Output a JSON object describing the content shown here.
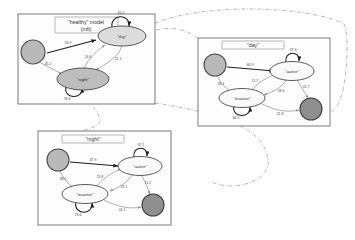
{
  "figure": {
    "background": "#ffffff",
    "accent_dark": "#1f1f1f",
    "accent_light": "#8d8d8d",
    "node_fill_day": "#dcdcdc",
    "node_fill_night": "#bdbdbd",
    "start_fill": "#b9b9b9",
    "end_fill": "#8f8f8f"
  },
  "panels": [
    {
      "id": "healthy",
      "title": "\"healthy\" model",
      "subtitle": "(mft)",
      "nodes": [
        {
          "name": "start",
          "label": "",
          "kind": "start"
        },
        {
          "name": "day",
          "label": "\"day\"",
          "kind": "state"
        },
        {
          "name": "night",
          "label": "\"night\"",
          "kind": "state"
        }
      ],
      "edges": [
        {
          "from": "start",
          "to": "day",
          "label": "54.9",
          "weight": "strong"
        },
        {
          "from": "start",
          "to": "night",
          "label": "45.1",
          "weight": "light"
        },
        {
          "from": "day",
          "to": "day",
          "label": "65.2",
          "weight": "strong"
        },
        {
          "from": "day",
          "to": "night",
          "label": "21.1",
          "weight": "light"
        },
        {
          "from": "night",
          "to": "day",
          "label": "14.6",
          "weight": "light"
        },
        {
          "from": "night",
          "to": "night",
          "label": "78.6",
          "weight": "strong"
        }
      ]
    },
    {
      "id": "day-sub",
      "title": "\"day\"",
      "subtitle": "",
      "nodes": [
        {
          "name": "start",
          "label": "",
          "kind": "start"
        },
        {
          "name": "active",
          "label": "\"active\"",
          "kind": "state"
        },
        {
          "name": "inactive",
          "label": "\"inactive\"",
          "kind": "state"
        },
        {
          "name": "end",
          "label": "",
          "kind": "end"
        }
      ],
      "edges": [
        {
          "from": "start",
          "to": "active",
          "label": "66.9",
          "weight": "strong"
        },
        {
          "from": "start",
          "to": "inactive",
          "label": "33.1",
          "weight": "light"
        },
        {
          "from": "active",
          "to": "active",
          "label": "67.3",
          "weight": "strong"
        },
        {
          "from": "active",
          "to": "inactive",
          "label": "18.6",
          "weight": "light"
        },
        {
          "from": "inactive",
          "to": "active",
          "label": "11.7",
          "weight": "light"
        },
        {
          "from": "inactive",
          "to": "inactive",
          "label": "66.5",
          "weight": "strong"
        },
        {
          "from": "active",
          "to": "end",
          "label": "41.7",
          "weight": "light"
        },
        {
          "from": "inactive",
          "to": "end",
          "label": "21.8",
          "weight": "light"
        }
      ]
    },
    {
      "id": "night-sub",
      "title": "\"night\"",
      "subtitle": "",
      "nodes": [
        {
          "name": "start",
          "label": "",
          "kind": "start"
        },
        {
          "name": "active",
          "label": "\"active\"",
          "kind": "state"
        },
        {
          "name": "inactive",
          "label": "\"inactive\"",
          "kind": "state"
        },
        {
          "name": "end",
          "label": "",
          "kind": "end"
        }
      ],
      "edges": [
        {
          "from": "start",
          "to": "active",
          "label": "47.9",
          "weight": "strong"
        },
        {
          "from": "start",
          "to": "inactive",
          "label": "48.1",
          "weight": "light"
        },
        {
          "from": "active",
          "to": "active",
          "label": "67.1",
          "weight": "strong"
        },
        {
          "from": "active",
          "to": "inactive",
          "label": "21.1",
          "weight": "light"
        },
        {
          "from": "inactive",
          "to": "active",
          "label": "11.8",
          "weight": "light"
        },
        {
          "from": "inactive",
          "to": "inactive",
          "label": "73.6",
          "weight": "strong"
        },
        {
          "from": "active",
          "to": "end",
          "label": "11.2",
          "weight": "light"
        },
        {
          "from": "inactive",
          "to": "end",
          "label": "24.1",
          "weight": "light"
        }
      ]
    }
  ],
  "connectors": [
    {
      "name": "day-expansion",
      "from": "healthy.day",
      "to": "day-sub"
    },
    {
      "name": "night-expansion",
      "from": "healthy.night",
      "to": "night-sub"
    }
  ]
}
